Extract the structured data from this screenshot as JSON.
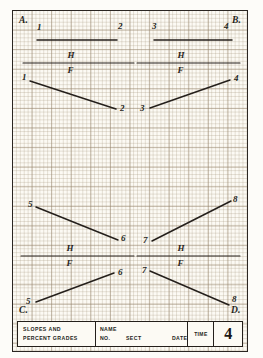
{
  "sheet": {
    "corner_labels": [
      {
        "id": "A",
        "text": "A.",
        "x": 6,
        "y": 4
      },
      {
        "id": "B",
        "text": "B.",
        "x": 219,
        "y": 4
      },
      {
        "id": "C",
        "text": "C.",
        "x": 6,
        "y": 294
      },
      {
        "id": "D",
        "text": "D.",
        "x": 218,
        "y": 294
      }
    ],
    "plane_label_h": "H",
    "plane_label_f": "F"
  },
  "drawing_data": {
    "type": "technical-drawing",
    "description": "Orthographic descriptive-geometry exercise: four problems (A, B, C, D) each showing a line in the horizontal (H) and frontal (F) projection planes, separated by a folding line.",
    "problems": [
      {
        "id": "A",
        "corner": "top-left",
        "folding_line": {
          "x1": 10,
          "y1": 52,
          "x2": 121,
          "y2": 52
        },
        "top_label": "H",
        "bottom_label": "F",
        "views": [
          {
            "plane": "H",
            "endpoints": [
              {
                "label": "1",
                "x": 24,
                "y": 29
              },
              {
                "label": "2",
                "x": 104,
                "y": 29
              }
            ],
            "label_positions": [
              {
                "label": "1",
                "x": 24,
                "y": 11
              },
              {
                "label": "2",
                "x": 105,
                "y": 10
              }
            ]
          },
          {
            "plane": "F",
            "endpoints": [
              {
                "label": "1",
                "x": 17,
                "y": 70
              },
              {
                "label": "2",
                "x": 103,
                "y": 98
              }
            ],
            "label_positions": [
              {
                "label": "1",
                "x": 9,
                "y": 61
              },
              {
                "label": "2",
                "x": 107,
                "y": 92
              }
            ]
          }
        ]
      },
      {
        "id": "B",
        "corner": "top-right",
        "folding_line": {
          "x1": 124,
          "y1": 52,
          "x2": 227,
          "y2": 52
        },
        "top_label": "H",
        "bottom_label": "F",
        "views": [
          {
            "plane": "H",
            "endpoints": [
              {
                "label": "3",
                "x": 141,
                "y": 29
              },
              {
                "label": "4",
                "x": 219,
                "y": 29
              }
            ],
            "label_positions": [
              {
                "label": "3",
                "x": 139,
                "y": 10
              },
              {
                "label": "4",
                "x": 211,
                "y": 10
              }
            ]
          },
          {
            "plane": "F",
            "endpoints": [
              {
                "label": "3",
                "x": 137,
                "y": 97
              },
              {
                "label": "4",
                "x": 217,
                "y": 69
              }
            ],
            "label_positions": [
              {
                "label": "3",
                "x": 127,
                "y": 92
              },
              {
                "label": "4",
                "x": 221,
                "y": 62
              }
            ]
          }
        ]
      },
      {
        "id": "C",
        "corner": "bottom-left",
        "folding_line": {
          "x1": 8,
          "y1": 245,
          "x2": 121,
          "y2": 245
        },
        "top_label": "H",
        "bottom_label": "F",
        "views": [
          {
            "plane": "H",
            "endpoints": [
              {
                "label": "5",
                "x": 23,
                "y": 196
              },
              {
                "label": "6",
                "x": 105,
                "y": 229
              }
            ],
            "label_positions": [
              {
                "label": "5",
                "x": 15,
                "y": 188
              },
              {
                "label": "6",
                "x": 108,
                "y": 222
              }
            ]
          },
          {
            "plane": "F",
            "endpoints": [
              {
                "label": "5",
                "x": 23,
                "y": 291
              },
              {
                "label": "6",
                "x": 101,
                "y": 262
              }
            ],
            "label_positions": [
              {
                "label": "5",
                "x": 13,
                "y": 285
              },
              {
                "label": "6",
                "x": 105,
                "y": 256
              }
            ]
          }
        ]
      },
      {
        "id": "D",
        "corner": "bottom-right",
        "folding_line": {
          "x1": 124,
          "y1": 245,
          "x2": 227,
          "y2": 245
        },
        "top_label": "H",
        "bottom_label": "F",
        "views": [
          {
            "plane": "H",
            "endpoints": [
              {
                "label": "7",
                "x": 139,
                "y": 230
              },
              {
                "label": "8",
                "x": 218,
                "y": 190
              }
            ],
            "label_positions": [
              {
                "label": "7",
                "x": 130,
                "y": 224
              },
              {
                "label": "8",
                "x": 220,
                "y": 183
              }
            ]
          },
          {
            "plane": "F",
            "endpoints": [
              {
                "label": "7",
                "x": 137,
                "y": 260
              },
              {
                "label": "8",
                "x": 216,
                "y": 294
              }
            ],
            "label_positions": [
              {
                "label": "7",
                "x": 129,
                "y": 254
              },
              {
                "label": "8",
                "x": 219,
                "y": 283
              }
            ]
          }
        ]
      }
    ]
  },
  "title_block": {
    "description_line1": "SLOPES  AND",
    "description_line2": "PERCENT  GRADES",
    "name_label": "NAME",
    "no_label": "NO.",
    "sect_label": "SECT",
    "date_label": "DATE",
    "time_label": "TIME",
    "sheet_number": "4"
  },
  "colors": {
    "ink": "#241f1b",
    "paper": "#fbf8f1",
    "grid_minor": "#ac9e86",
    "grid_major": "#96846c"
  }
}
